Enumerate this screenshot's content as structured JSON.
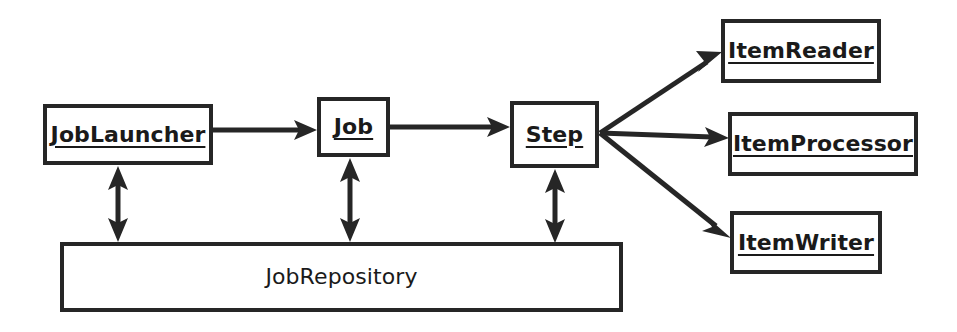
{
  "diagram": {
    "stroke_color": "#262626",
    "text_color": "#1a1a1a",
    "background_color": "#ffffff",
    "nodes": [
      {
        "id": "job-launcher",
        "label": "JobLauncher",
        "style": "emphasis",
        "x": 43,
        "y": 104,
        "w": 170,
        "h": 61
      },
      {
        "id": "job",
        "label": "Job",
        "style": "emphasis",
        "x": 317,
        "y": 97,
        "w": 73,
        "h": 60
      },
      {
        "id": "step",
        "label": "Step",
        "style": "emphasis",
        "x": 510,
        "y": 101,
        "w": 89,
        "h": 67
      },
      {
        "id": "item-reader",
        "label": "ItemReader",
        "style": "emphasis",
        "x": 721,
        "y": 19,
        "w": 160,
        "h": 64
      },
      {
        "id": "item-processor",
        "label": "ItemProcessor",
        "style": "emphasis",
        "x": 728,
        "y": 112,
        "w": 190,
        "h": 64
      },
      {
        "id": "item-writer",
        "label": "ItemWriter",
        "style": "emphasis",
        "x": 730,
        "y": 211,
        "w": 152,
        "h": 63
      },
      {
        "id": "job-repository",
        "label": "JobRepository",
        "style": "plain",
        "x": 60,
        "y": 242,
        "w": 563,
        "h": 70
      }
    ],
    "edges": [
      {
        "id": "job-launcher-to-job",
        "from": "job-launcher",
        "to": "job",
        "kind": "single-arrow",
        "orientation": "horizontal"
      },
      {
        "id": "job-to-step",
        "from": "job",
        "to": "step",
        "kind": "single-arrow",
        "orientation": "horizontal"
      },
      {
        "id": "step-to-item-reader",
        "from": "step",
        "to": "item-reader",
        "kind": "single-arrow",
        "orientation": "diagonal-up"
      },
      {
        "id": "step-to-item-processor",
        "from": "step",
        "to": "item-processor",
        "kind": "single-arrow",
        "orientation": "horizontal"
      },
      {
        "id": "step-to-item-writer",
        "from": "step",
        "to": "item-writer",
        "kind": "single-arrow",
        "orientation": "diagonal-down"
      },
      {
        "id": "job-launcher-to-repo",
        "from": "job-launcher",
        "to": "job-repository",
        "kind": "double-arrow",
        "orientation": "vertical"
      },
      {
        "id": "job-to-repo",
        "from": "job",
        "to": "job-repository",
        "kind": "double-arrow",
        "orientation": "vertical"
      },
      {
        "id": "step-to-repo",
        "from": "step",
        "to": "job-repository",
        "kind": "double-arrow",
        "orientation": "vertical"
      }
    ]
  }
}
